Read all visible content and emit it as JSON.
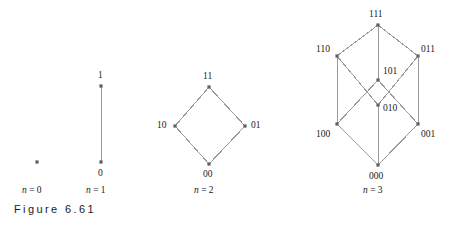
{
  "figure": {
    "caption": "Figure 6.61",
    "background_color": "#ffffff",
    "edge_color": "#9a9a9a",
    "node_color": "#5f5f5f",
    "text_color": "#1a1a1a"
  },
  "panels": [
    {
      "id": "n0",
      "caption_prefix": "n",
      "caption_eq": "= 0",
      "caption_full": "n = 0",
      "caption_x": 22,
      "caption_y": 186,
      "nodes": [
        {
          "label": "",
          "x": 37,
          "y": 162,
          "label_x": 0,
          "label_y": 0,
          "show_label": false
        }
      ],
      "edges": []
    },
    {
      "id": "n1",
      "caption_prefix": "n",
      "caption_eq": "= 1",
      "caption_full": "n = 1",
      "caption_x": 86,
      "caption_y": 186,
      "nodes": [
        {
          "label": "1",
          "x": 101,
          "y": 86,
          "label_x": 98,
          "label_y": 71,
          "show_label": true
        },
        {
          "label": "0",
          "x": 101,
          "y": 162,
          "label_x": 98,
          "label_y": 169,
          "show_label": true
        }
      ],
      "edges": [
        {
          "from": 0,
          "to": 1
        }
      ]
    },
    {
      "id": "n2",
      "caption_prefix": "n",
      "caption_eq": "= 2",
      "caption_full": "n = 2",
      "caption_x": 194,
      "caption_y": 186,
      "nodes": [
        {
          "label": "11",
          "x": 209,
          "y": 87,
          "label_x": 203,
          "label_y": 72,
          "show_label": true
        },
        {
          "label": "10",
          "x": 175,
          "y": 126,
          "label_x": 157,
          "label_y": 121,
          "show_label": true
        },
        {
          "label": "01",
          "x": 245,
          "y": 126,
          "label_x": 251,
          "label_y": 121,
          "show_label": true
        },
        {
          "label": "00",
          "x": 209,
          "y": 164,
          "label_x": 203,
          "label_y": 170,
          "show_label": true
        }
      ],
      "edges": [
        {
          "from": 3,
          "to": 1
        },
        {
          "from": 3,
          "to": 2
        },
        {
          "from": 1,
          "to": 0
        },
        {
          "from": 2,
          "to": 0
        }
      ]
    },
    {
      "id": "n3",
      "caption_prefix": "n",
      "caption_eq": "= 3",
      "caption_full": "n = 3",
      "caption_x": 363,
      "caption_y": 186,
      "nodes": [
        {
          "label": "111",
          "x": 378,
          "y": 25,
          "label_x": 369,
          "label_y": 10,
          "show_label": true
        },
        {
          "label": "110",
          "x": 337,
          "y": 56,
          "label_x": 316,
          "label_y": 45,
          "show_label": true
        },
        {
          "label": "011",
          "x": 418,
          "y": 56,
          "label_x": 421,
          "label_y": 45,
          "show_label": true
        },
        {
          "label": "101",
          "x": 378,
          "y": 80,
          "label_x": 383,
          "label_y": 67,
          "show_label": true
        },
        {
          "label": "010",
          "x": 378,
          "y": 105,
          "label_x": 383,
          "label_y": 104,
          "show_label": true
        },
        {
          "label": "100",
          "x": 337,
          "y": 124,
          "label_x": 316,
          "label_y": 130,
          "show_label": true
        },
        {
          "label": "001",
          "x": 418,
          "y": 124,
          "label_x": 421,
          "label_y": 130,
          "show_label": true
        },
        {
          "label": "000",
          "x": 378,
          "y": 165,
          "label_x": 369,
          "label_y": 172,
          "show_label": true
        }
      ],
      "edges": [
        {
          "from": 7,
          "to": 5
        },
        {
          "from": 7,
          "to": 4
        },
        {
          "from": 7,
          "to": 6
        },
        {
          "from": 5,
          "to": 1
        },
        {
          "from": 5,
          "to": 3
        },
        {
          "from": 4,
          "to": 1
        },
        {
          "from": 4,
          "to": 2
        },
        {
          "from": 6,
          "to": 3
        },
        {
          "from": 6,
          "to": 2
        },
        {
          "from": 1,
          "to": 0
        },
        {
          "from": 3,
          "to": 0
        },
        {
          "from": 2,
          "to": 0
        }
      ]
    }
  ]
}
